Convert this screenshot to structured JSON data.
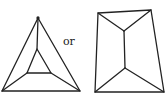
{
  "diagram": {
    "connector_text": "or",
    "stroke_color": "#222222",
    "background": "#ffffff",
    "figures": [
      {
        "name": "triangle-with-inner-triangle",
        "outer": [
          [
            38,
            18
          ],
          [
            2,
            91
          ],
          [
            80,
            91
          ]
        ],
        "inner": [
          [
            37,
            49
          ],
          [
            27,
            73
          ],
          [
            51,
            73
          ]
        ],
        "edges_outer_to_inner": [
          [
            [
              38,
              18
            ],
            [
              37,
              49
            ]
          ],
          [
            [
              2,
              91
            ],
            [
              27,
              73
            ]
          ],
          [
            [
              80,
              91
            ],
            [
              51,
              73
            ]
          ]
        ]
      },
      {
        "name": "quadrilateral-with-inner-segment",
        "outer": [
          [
            98,
            13
          ],
          [
            151,
            10
          ],
          [
            164,
            92
          ],
          [
            95,
            92
          ]
        ],
        "inner_segment": [
          [
            124,
            31
          ],
          [
            125,
            68
          ]
        ],
        "edges_outer_to_inner": [
          [
            [
              98,
              13
            ],
            [
              124,
              31
            ]
          ],
          [
            [
              151,
              10
            ],
            [
              124,
              31
            ]
          ],
          [
            [
              95,
              92
            ],
            [
              125,
              68
            ]
          ],
          [
            [
              164,
              92
            ],
            [
              125,
              68
            ]
          ]
        ]
      }
    ]
  }
}
